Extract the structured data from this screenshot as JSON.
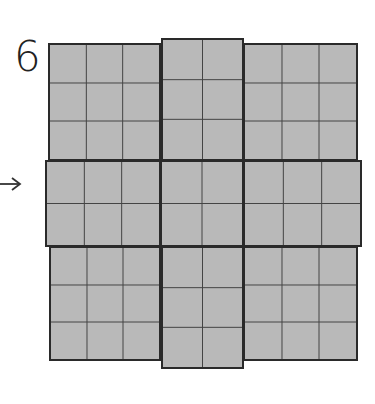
{
  "figure": {
    "label": "6",
    "arrow_icon": "right-arrow-icon",
    "fill_color": "#b9b9b9",
    "line_color": "#2a2a2a",
    "blocks": [
      {
        "name": "top-left",
        "x": 48,
        "y": 43,
        "w": 113,
        "h": 118,
        "cols": 3,
        "rows": 3
      },
      {
        "name": "top-center",
        "x": 161,
        "y": 38,
        "w": 83,
        "h": 123,
        "cols": 2,
        "rows": 3
      },
      {
        "name": "top-right",
        "x": 243,
        "y": 43,
        "w": 115,
        "h": 118,
        "cols": 3,
        "rows": 3
      },
      {
        "name": "middle-left",
        "x": 45,
        "y": 160,
        "w": 116,
        "h": 87,
        "cols": 3,
        "rows": 2
      },
      {
        "name": "middle-center",
        "x": 160,
        "y": 160,
        "w": 84,
        "h": 87,
        "cols": 2,
        "rows": 2
      },
      {
        "name": "middle-right",
        "x": 243,
        "y": 160,
        "w": 119,
        "h": 87,
        "cols": 3,
        "rows": 2
      },
      {
        "name": "bottom-left",
        "x": 49,
        "y": 246,
        "w": 112,
        "h": 115,
        "cols": 3,
        "rows": 3
      },
      {
        "name": "bottom-center",
        "x": 161,
        "y": 246,
        "w": 83,
        "h": 123,
        "cols": 2,
        "rows": 3
      },
      {
        "name": "bottom-right",
        "x": 243,
        "y": 246,
        "w": 115,
        "h": 115,
        "cols": 3,
        "rows": 3
      }
    ]
  }
}
